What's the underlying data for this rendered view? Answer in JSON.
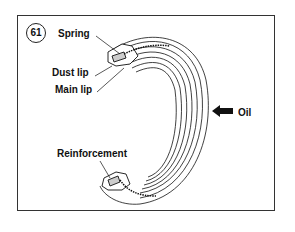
{
  "figure": {
    "number": "61",
    "labels": {
      "spring": "Spring",
      "dust_lip": "Dust lip",
      "main_lip": "Main lip",
      "oil": "Oil",
      "reinforcement": "Reinforcement"
    }
  }
}
